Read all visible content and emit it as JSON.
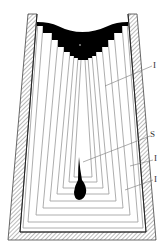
{
  "diagram": {
    "labels": [
      {
        "id": "label-I-top",
        "text": "I"
      },
      {
        "id": "label-S",
        "text": "S"
      },
      {
        "id": "label-I-mid",
        "text": "I"
      },
      {
        "id": "label-I-bottom",
        "text": "I"
      }
    ],
    "colors": {
      "wall_hatch": "#555555",
      "layer_lines": "#999999",
      "cap_fill": "#000000",
      "cavity_fill": "#000000"
    }
  }
}
